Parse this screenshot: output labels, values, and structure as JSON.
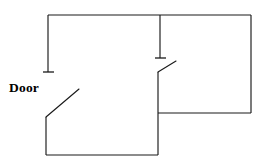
{
  "diagram": {
    "type": "floor-plan",
    "canvas": {
      "width": 260,
      "height": 165,
      "background": "#ffffff"
    },
    "stroke_color": "#1a1a1a",
    "stroke_width": 1.15,
    "labels": [
      {
        "id": "door",
        "text": "Door",
        "x": 9,
        "y": 81,
        "bold": true
      }
    ],
    "walls": [
      {
        "name": "left-wall-upper",
        "points": "48,72 48,15",
        "description": "left exterior wall running up from door jamb to top-left corner"
      },
      {
        "name": "top-wall",
        "points": "48,15 251,15",
        "description": "top exterior wall spanning full width"
      },
      {
        "name": "right-wall",
        "points": "251,15 251,113",
        "description": "right exterior wall of the right room"
      },
      {
        "name": "bottom-wall-right-room",
        "points": "251,113 158,113",
        "description": "bottom wall of the right room running left to the partition"
      },
      {
        "name": "partition-wall-upper",
        "points": "160,15 160,58",
        "description": "interior partition dropping from top wall to the interior door head"
      },
      {
        "name": "partition-wall-lower",
        "points": "158,72 158,155",
        "description": "interior partition continuing below the interior door down to the bottom wall"
      },
      {
        "name": "bottom-wall-left-room",
        "points": "158,155 46,155",
        "description": "bottom wall of the left room"
      },
      {
        "name": "left-wall-lower",
        "points": "46,155 46,117",
        "description": "left wall segment rising from bottom-left corner to the main door hinge"
      }
    ],
    "jambs": [
      {
        "name": "main-door-jamb-tick",
        "points": "43,72 54,72",
        "description": "wall end cap at the main entry door head"
      },
      {
        "name": "interior-door-jamb-tick",
        "points": "155,58 166,58",
        "description": "wall end cap at the interior door head"
      }
    ],
    "door_swings": [
      {
        "name": "main-door-swing",
        "points": "46,117 79,89",
        "label": "Door",
        "description": "main entry door leaf swinging open into the left room"
      },
      {
        "name": "interior-door-swing",
        "points": "158,72 176,61",
        "description": "interior door leaf swinging open into the right room"
      }
    ]
  }
}
